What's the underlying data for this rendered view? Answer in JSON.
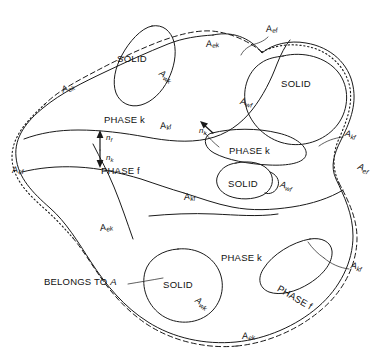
{
  "figure": {
    "background_color": "#ffffff",
    "line_color": "#1a1a1a",
    "text_color": "#111111"
  },
  "phase_labels": [
    {
      "id": "phase-k-upper",
      "text": "PHASE k",
      "x": 104,
      "y": 115
    },
    {
      "id": "phase-k-mid",
      "text": "PHASE k",
      "x": 229,
      "y": 146
    },
    {
      "id": "phase-f-left",
      "text": "PHASE f",
      "x": 101,
      "y": 166
    },
    {
      "id": "phase-k-lower",
      "text": "PHASE k",
      "x": 221,
      "y": 253
    },
    {
      "id": "phase-f-island",
      "text": "PHASE f",
      "x": 287,
      "y": 277
    }
  ],
  "solid_labels": [
    {
      "id": "solid-top-left",
      "text": "SOLID",
      "x": 117,
      "y": 54
    },
    {
      "id": "solid-top-right",
      "text": "SOLID",
      "x": 294,
      "y": 79
    },
    {
      "id": "solid-middle",
      "text": "SOLID",
      "x": 248,
      "y": 184
    },
    {
      "id": "solid-bottom",
      "text": "SOLID",
      "x": 173,
      "y": 287
    }
  ],
  "annotation_labels": [
    {
      "id": "belongs-to-a",
      "text": "BELONGS TO ",
      "italic_suffix": "A",
      "x": 44,
      "y": 281
    }
  ],
  "area_labels": [
    {
      "id": "a-ek-upper-left",
      "base": "A",
      "sub": "ek",
      "x": 62,
      "y": 90,
      "rotation": -24
    },
    {
      "id": "a-ek-top",
      "base": "A",
      "sub": "ek",
      "x": 206,
      "y": 44,
      "rotation": -8
    },
    {
      "id": "a-wk-top",
      "base": "A",
      "sub": "wk",
      "x": 160,
      "y": 72,
      "rotation": 30
    },
    {
      "id": "a-ef-top-right",
      "base": "A",
      "sub": "ef",
      "x": 269,
      "y": 29,
      "rotation": -8
    },
    {
      "id": "a-wf-upper",
      "base": "A",
      "sub": "wf",
      "x": 242,
      "y": 101,
      "rotation": 8
    },
    {
      "id": "a-kf-left",
      "base": "A",
      "sub": "kf",
      "x": 162,
      "y": 126,
      "rotation": -10
    },
    {
      "id": "a-kf-right-upper",
      "base": "A",
      "sub": "kf",
      "x": 345,
      "y": 133,
      "rotation": 10
    },
    {
      "id": "a-ef-left",
      "base": "A",
      "sub": "ef",
      "x": 12,
      "y": 170,
      "rotation": -6
    },
    {
      "id": "a-ef-right",
      "base": "A",
      "sub": "ef",
      "x": 358,
      "y": 166,
      "rotation": 20
    },
    {
      "id": "a-kf-mid-left",
      "base": "A",
      "sub": "kf",
      "x": 186,
      "y": 197,
      "rotation": -8
    },
    {
      "id": "a-wf-mid",
      "base": "A",
      "sub": "wf",
      "x": 281,
      "y": 184,
      "rotation": 14
    },
    {
      "id": "a-ek-mid-left",
      "base": "A",
      "sub": "ek",
      "x": 100,
      "y": 228,
      "rotation": -12
    },
    {
      "id": "a-kf-right-lower",
      "base": "A",
      "sub": "kf",
      "x": 351,
      "y": 265,
      "rotation": 10
    },
    {
      "id": "a-wk-bottom",
      "base": "A",
      "sub": "wk",
      "x": 197,
      "y": 299,
      "rotation": 34
    },
    {
      "id": "a-ek-bottom",
      "base": "A",
      "sub": "ek",
      "x": 243,
      "y": 336,
      "rotation": -6
    }
  ],
  "normal_vectors": [
    {
      "id": "n-f",
      "base": "n",
      "sub": "f",
      "x": 106,
      "y": 138,
      "direction": "up"
    },
    {
      "id": "n-k",
      "base": "n",
      "sub": "k",
      "x": 106,
      "y": 157,
      "direction": "down"
    },
    {
      "id": "n-k-arrow-right",
      "base": "n",
      "sub": "k",
      "x": 201,
      "y": 123,
      "direction": "up-right"
    }
  ],
  "legend": {
    "solid_line": "phase interface",
    "dashed_line": "averaging volume boundary in k-phase",
    "dotted_line": "averaging volume boundary in f-phase"
  }
}
